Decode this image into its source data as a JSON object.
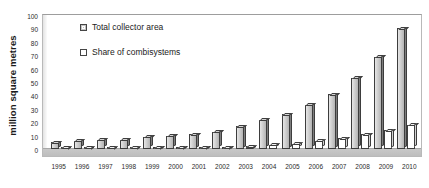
{
  "chart_data": {
    "type": "bar",
    "title": "",
    "subtitle": "",
    "xlabel": "",
    "ylabel": "million square metres",
    "ylim": [
      0,
      100
    ],
    "yticks": [
      0,
      10,
      20,
      30,
      40,
      50,
      60,
      70,
      80,
      90,
      100
    ],
    "grid": false,
    "legend_position": "inside-top-left",
    "categories": [
      "1995",
      "1996",
      "1997",
      "1998",
      "1999",
      "2000",
      "2001",
      "2002",
      "2003",
      "2004",
      "2005",
      "2006",
      "2007",
      "2008",
      "2009",
      "2010"
    ],
    "series": [
      {
        "name": "Total collector area",
        "color": "#c4c4c4",
        "values": [
          5,
          6,
          7,
          7,
          9,
          10,
          11,
          13,
          17,
          22,
          26,
          33,
          41,
          53,
          69,
          90
        ]
      },
      {
        "name": "Share of combisystems",
        "color": "#ffffff",
        "values": [
          0.3,
          0.3,
          0.4,
          0.5,
          0.6,
          0.8,
          1.0,
          1.3,
          2.0,
          3.0,
          4.0,
          6.0,
          8.0,
          11.0,
          14.0,
          18.0
        ]
      }
    ]
  },
  "legend": {
    "entries": [
      {
        "label": "Total collector area",
        "swatch": "legend-swatch-total"
      },
      {
        "label": "Share of combisystems",
        "swatch": "legend-swatch-share"
      }
    ]
  },
  "axes": {
    "y_title": "million square metres"
  }
}
